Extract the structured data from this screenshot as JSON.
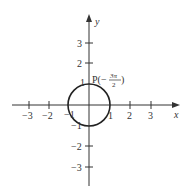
{
  "diagram": {
    "type": "unit-circle",
    "axes": {
      "x_label": "x",
      "y_label": "y",
      "x_ticks": [
        -3,
        -2,
        -1,
        1,
        2,
        3
      ],
      "y_ticks": [
        3,
        2,
        1,
        -1,
        -2,
        -3
      ],
      "x_tick_labels": [
        "−3",
        "−2",
        "−1",
        "1",
        "2",
        "3"
      ],
      "y_tick_labels": [
        "3",
        "2",
        "1",
        "−1",
        "−2",
        "−3"
      ]
    },
    "circle": {
      "center": [
        0,
        0
      ],
      "radius": 1
    },
    "point": {
      "label_prefix": "P(−",
      "numerator": "3π",
      "denominator": "2",
      "label_suffix": ")",
      "coordinates": [
        0,
        1
      ]
    },
    "colors": {
      "stroke": "#333333",
      "circle": "#222222"
    }
  }
}
